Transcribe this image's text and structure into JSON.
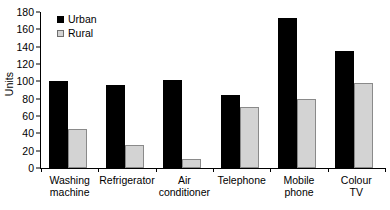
{
  "chart_data": {
    "type": "bar",
    "title": "",
    "subtitle": "",
    "xlabel": "",
    "ylabel": "Units",
    "ylim": [
      0,
      180
    ],
    "ytick_step": 20,
    "yticks": [
      0,
      20,
      40,
      60,
      80,
      100,
      120,
      140,
      160,
      180
    ],
    "grid": false,
    "legend_position": "top-left-inside",
    "categories": [
      "Washing machine",
      "Refrigerator",
      "Air conditioner",
      "Telephone",
      "Mobile phone",
      "Colour TV"
    ],
    "category_lines": [
      [
        "Washing",
        "machine"
      ],
      [
        "Refrigerator"
      ],
      [
        "Air",
        "conditioner"
      ],
      [
        "Telephone"
      ],
      [
        "Mobile",
        "phone"
      ],
      [
        "Colour",
        "TV"
      ]
    ],
    "series": [
      {
        "name": "Urban",
        "color": "#000000",
        "values": [
          100,
          96,
          102,
          84,
          173,
          135
        ]
      },
      {
        "name": "Rural",
        "color": "#d3d3d3",
        "border_color": "#8a8a8a",
        "values": [
          45,
          26,
          10,
          70,
          80,
          98
        ]
      }
    ]
  },
  "legend": {
    "items": [
      {
        "label": "Urban",
        "swatch": "filled-black-square"
      },
      {
        "label": "Rural",
        "swatch": "light-gray-square"
      }
    ]
  }
}
